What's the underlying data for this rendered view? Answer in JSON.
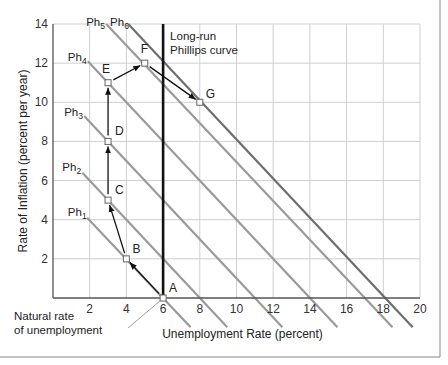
{
  "chart_data": {
    "type": "line",
    "title": "",
    "xlabel": "Unemployment Rate (percent)",
    "ylabel": "Rate of Inflation (percent per year)",
    "xlim": [
      0,
      20
    ],
    "ylim": [
      0,
      14
    ],
    "grid": true,
    "x_ticks": [
      2,
      4,
      6,
      8,
      10,
      12,
      14,
      16,
      18,
      20
    ],
    "y_ticks": [
      2,
      4,
      6,
      8,
      10,
      12,
      14
    ],
    "series": [
      {
        "name": "Ph1",
        "label_main": "Ph",
        "label_sub": "1",
        "x": [
          1.86,
          7.5
        ],
        "y": [
          4.1,
          -1.5
        ],
        "color": "#9a9a9a",
        "label_pos": [
          1.9,
          4.4
        ]
      },
      {
        "name": "Ph2",
        "label_main": "Ph",
        "label_sub": "2",
        "x": [
          1.6,
          9.5
        ],
        "y": [
          6.4,
          -1.5
        ],
        "color": "#9a9a9a",
        "label_pos": [
          1.6,
          6.7
        ]
      },
      {
        "name": "Ph3",
        "label_main": "Ph",
        "label_sub": "3",
        "x": [
          1.7,
          12.5
        ],
        "y": [
          9.3,
          -1.5
        ],
        "color": "#9a9a9a",
        "label_pos": [
          1.7,
          9.5
        ]
      },
      {
        "name": "Ph4",
        "label_main": "Ph",
        "label_sub": "4",
        "x": [
          1.9,
          15.5
        ],
        "y": [
          12.1,
          -1.5
        ],
        "color": "#9a9a9a",
        "label_pos": [
          1.9,
          12.3
        ]
      },
      {
        "name": "Ph5",
        "label_main": "Ph",
        "label_sub": "5",
        "x": [
          2.9,
          18.5
        ],
        "y": [
          14,
          -1.5
        ],
        "color": "#9a9a9a",
        "label_pos": [
          2.9,
          14.1
        ]
      },
      {
        "name": "Ph6",
        "label_main": "Ph",
        "label_sub": "6",
        "x": [
          4.1,
          19.6
        ],
        "y": [
          14,
          -1.5
        ],
        "color": "#6e6e6e",
        "label_pos": [
          4.2,
          14.1
        ]
      }
    ],
    "long_run_curve": {
      "x": 6,
      "label_line1": "Long-run",
      "label_line2": "Phillips curve"
    },
    "points": [
      {
        "name": "A",
        "x": 6,
        "y": 0
      },
      {
        "name": "B",
        "x": 4,
        "y": 2
      },
      {
        "name": "C",
        "x": 3,
        "y": 5
      },
      {
        "name": "D",
        "x": 3,
        "y": 8
      },
      {
        "name": "E",
        "x": 3,
        "y": 11
      },
      {
        "name": "F",
        "x": 5,
        "y": 12
      },
      {
        "name": "G",
        "x": 8,
        "y": 10
      }
    ],
    "arrows": [
      {
        "from": "A",
        "to": "B"
      },
      {
        "from": "B",
        "to": "C"
      },
      {
        "from": "C",
        "to": "D"
      },
      {
        "from": "D",
        "to": "E"
      },
      {
        "from": "E",
        "to": "F"
      },
      {
        "from": "F",
        "to": "G"
      }
    ],
    "annotations": [
      {
        "text_line1": "Natural rate",
        "text_line2": "of unemployment",
        "points_to": "A"
      }
    ]
  }
}
